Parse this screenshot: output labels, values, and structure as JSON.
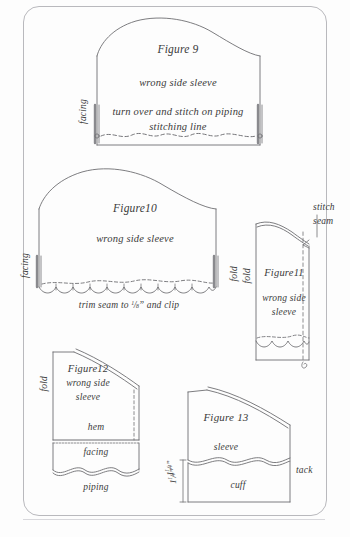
{
  "page": {
    "kind": "scanned-instruction-page",
    "ink_color": "#3a3a3a",
    "line_color": "#6e6e72",
    "frame_color": "#b9b9bd",
    "background": "#fdfdfd"
  },
  "figures": [
    {
      "id": "figure-9",
      "title": "Figure 9",
      "lines": [
        "wrong side sleeve",
        "turn over and stitch on piping",
        "stitching line"
      ],
      "edge_labels": [
        {
          "name": "facing",
          "text": "facing",
          "side": "left",
          "orientation": "vertical"
        }
      ]
    },
    {
      "id": "figure-10",
      "title": "Figure10",
      "lines": [
        "wrong side sleeve"
      ],
      "caption": {
        "prefix": "trim seam to ",
        "fraction_numerator": "1",
        "fraction_denominator": "8",
        "suffix": "” and clip",
        "full": "trim seam to 1/8” and clip"
      },
      "edge_labels": [
        {
          "name": "facing",
          "text": "facing",
          "side": "left",
          "orientation": "vertical"
        },
        {
          "name": "fold",
          "text": "fold",
          "side": "right",
          "orientation": "vertical"
        }
      ]
    },
    {
      "id": "figure-11",
      "title": "Figure11",
      "lines": [
        "wrong side",
        "sleeve"
      ],
      "annotation": {
        "name": "stitch-seam",
        "line1": "stitch",
        "line2": "seam"
      },
      "edge_labels": [
        {
          "name": "fold",
          "text": "fold",
          "side": "left",
          "orientation": "vertical"
        }
      ]
    },
    {
      "id": "figure-12",
      "title": "Figure12",
      "lines": [
        "wrong side",
        "sleeve"
      ],
      "parts": [
        {
          "name": "hem",
          "text": "hem"
        },
        {
          "name": "facing",
          "text": "facing"
        },
        {
          "name": "piping",
          "text": "piping"
        }
      ],
      "edge_labels": [
        {
          "name": "fold",
          "text": "fold",
          "side": "left",
          "orientation": "vertical"
        }
      ],
      "measurement": {
        "name": "cuff-depth",
        "whole": "1",
        "fraction_numerator": "1",
        "fraction_denominator": "4",
        "unit": "”",
        "full": "1 1/4”"
      }
    },
    {
      "id": "figure-13",
      "title": "Figure 13",
      "parts": [
        {
          "name": "sleeve",
          "text": "sleeve"
        },
        {
          "name": "cuff",
          "text": "cuff"
        }
      ],
      "annotation": {
        "name": "tack",
        "text": "tack"
      },
      "measurement": {
        "name": "cuff-depth",
        "whole": "1",
        "fraction_numerator": "1",
        "fraction_denominator": "4",
        "unit": "”",
        "full": "1 1/4”"
      }
    }
  ]
}
